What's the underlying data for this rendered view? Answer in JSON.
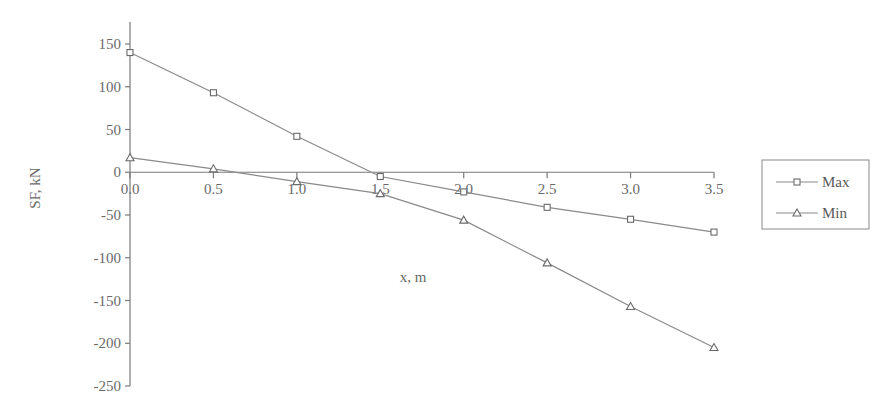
{
  "chart_data": {
    "type": "line",
    "title": "",
    "xlabel": "x, m",
    "ylabel": "SF, kN",
    "x": [
      0.0,
      0.5,
      1.0,
      1.5,
      2.0,
      2.5,
      3.0,
      3.5
    ],
    "xlim": [
      0.0,
      3.5
    ],
    "ylim": [
      -250,
      150
    ],
    "x_ticks": [
      "0.0",
      "0.5",
      "1.0",
      "1.5",
      "2.0",
      "2.5",
      "3.0",
      "3.5"
    ],
    "x_tick_values": [
      0.0,
      0.5,
      1.0,
      1.5,
      2.0,
      2.5,
      3.0,
      3.5
    ],
    "y_ticks": [
      "150",
      "100",
      "50",
      "0",
      "-50",
      "-100",
      "-150",
      "-200",
      "-250"
    ],
    "y_tick_values": [
      150,
      100,
      50,
      0,
      -50,
      -100,
      -150,
      -200,
      -250
    ],
    "grid": false,
    "legend_position": "right",
    "series": [
      {
        "name": "Max",
        "marker": "square",
        "values": [
          140,
          93,
          42,
          -5,
          -23,
          -41,
          -55,
          -70
        ]
      },
      {
        "name": "Min",
        "marker": "triangle",
        "values": [
          17,
          4,
          -11,
          -25,
          -56,
          -106,
          -157,
          -205
        ]
      }
    ],
    "colors": {
      "line": "#8a8a8a",
      "marker": "#6a6a6a",
      "text": "#6a6a6a"
    }
  }
}
